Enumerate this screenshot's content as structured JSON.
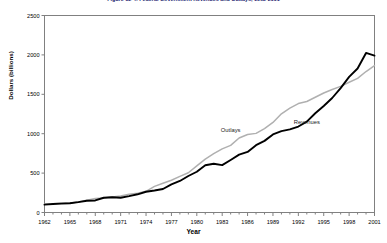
{
  "chart_data": {
    "type": "line",
    "title": "Figure 12-4:  Federal Government Revenues and Outlays, 1962-2001",
    "xlabel": "Year",
    "ylabel": "Dollars (billions)",
    "xlim": [
      1962,
      2001
    ],
    "ylim": [
      0,
      2500
    ],
    "ytick_labels": [
      "0",
      "500",
      "1000",
      "1500",
      "2000",
      "2500"
    ],
    "ytick_values": [
      0,
      500,
      1000,
      1500,
      2000,
      2500
    ],
    "xtick_labels": [
      "1962",
      "1965",
      "1968",
      "1971",
      "1974",
      "1977",
      "1980",
      "1983",
      "1986",
      "1989",
      "1992",
      "1995",
      "1998",
      "2001"
    ],
    "xtick_values": [
      1962,
      1965,
      1968,
      1971,
      1974,
      1977,
      1980,
      1983,
      1986,
      1989,
      1992,
      1995,
      1998,
      2001
    ],
    "grid": false,
    "legend_position": "inline-annotation",
    "x": [
      1962,
      1963,
      1964,
      1965,
      1966,
      1967,
      1968,
      1969,
      1970,
      1971,
      1972,
      1973,
      1974,
      1975,
      1976,
      1977,
      1978,
      1979,
      1980,
      1981,
      1982,
      1983,
      1984,
      1985,
      1986,
      1987,
      1988,
      1989,
      1990,
      1991,
      1992,
      1993,
      1994,
      1995,
      1996,
      1997,
      1998,
      1999,
      2000,
      2001
    ],
    "series": [
      {
        "name": "Outlays",
        "color": "#b0b0b0",
        "label_x": 1984,
        "label_y": 1020,
        "values": [
          107,
          111,
          119,
          118,
          135,
          157,
          178,
          184,
          196,
          210,
          231,
          246,
          269,
          332,
          372,
          409,
          459,
          504,
          591,
          678,
          746,
          808,
          852,
          946,
          990,
          1004,
          1064,
          1143,
          1253,
          1324,
          1382,
          1409,
          1462,
          1516,
          1561,
          1601,
          1653,
          1702,
          1789,
          1864
        ]
      },
      {
        "name": "Revenues",
        "color": "#000000",
        "label_x": 1993,
        "label_y": 1120,
        "values": [
          100,
          107,
          113,
          117,
          131,
          149,
          153,
          187,
          193,
          187,
          207,
          231,
          263,
          279,
          298,
          356,
          400,
          463,
          517,
          599,
          618,
          601,
          666,
          734,
          769,
          854,
          909,
          991,
          1032,
          1055,
          1091,
          1154,
          1259,
          1352,
          1453,
          1579,
          1722,
          1827,
          2025,
          1991
        ]
      }
    ]
  }
}
